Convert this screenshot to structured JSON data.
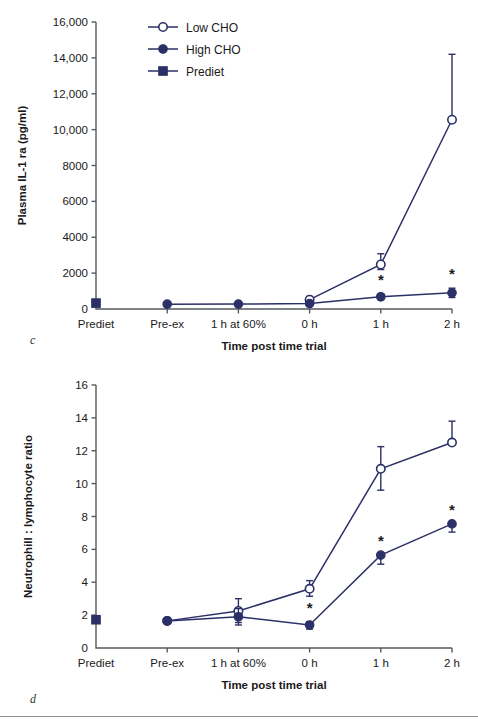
{
  "figure": {
    "background_color": "#ffffff",
    "series_color": "#2b3066",
    "axis_color": "#555a5e",
    "panels": [
      {
        "letter": "c",
        "name": "plasma-il1ra-chart"
      },
      {
        "letter": "d",
        "name": "neutrophil-lymphocyte-chart"
      }
    ]
  },
  "legend": {
    "position": "top-center",
    "entries": [
      {
        "label": "Low CHO",
        "marker": "open-circle-marker"
      },
      {
        "label": "High CHO",
        "marker": "filled-circle-marker"
      },
      {
        "label": "Prediet",
        "marker": "filled-square-marker"
      }
    ]
  },
  "chart_data": [
    {
      "type": "line",
      "panel": "c",
      "title": "",
      "xlabel": "Time post time trial",
      "ylabel": "Plasma IL-1 ra (pg/ml)",
      "categories": [
        "Prediet",
        "Pre-ex",
        "1 h at 60%",
        "0 h",
        "1 h",
        "2 h"
      ],
      "ytick_labels": [
        "0",
        "2000",
        "4000",
        "6000",
        "8000",
        "10,000",
        "12,000",
        "14,000",
        "16,000"
      ],
      "ytick_values": [
        0,
        2000,
        4000,
        6000,
        8000,
        10000,
        12000,
        14000,
        16000
      ],
      "ylim": [
        0,
        16000
      ],
      "grid": false,
      "legend_position": "top-center",
      "series": [
        {
          "name": "Low CHO",
          "marker": "open-circle-marker",
          "values": [
            null,
            null,
            null,
            520,
            2480,
            10550
          ],
          "err_upper": [
            null,
            null,
            null,
            180,
            600,
            3650
          ],
          "err_lower": [
            null,
            null,
            null,
            180,
            280,
            0
          ],
          "significance": [
            null,
            null,
            null,
            null,
            null,
            null
          ]
        },
        {
          "name": "High CHO",
          "marker": "filled-circle-marker",
          "values": [
            null,
            270,
            275,
            300,
            680,
            900
          ],
          "err_upper": [
            null,
            0,
            0,
            0,
            150,
            260
          ],
          "err_lower": [
            null,
            0,
            0,
            0,
            150,
            260
          ],
          "significance": [
            null,
            null,
            null,
            null,
            "*",
            "*"
          ]
        },
        {
          "name": "Prediet",
          "marker": "filled-square-marker",
          "values": [
            330,
            null,
            null,
            null,
            null,
            null
          ],
          "err_upper": [
            0,
            null,
            null,
            null,
            null,
            null
          ],
          "err_lower": [
            0,
            null,
            null,
            null,
            null,
            null
          ],
          "significance": [
            null,
            null,
            null,
            null,
            null,
            null
          ]
        }
      ]
    },
    {
      "type": "line",
      "panel": "d",
      "title": "",
      "xlabel": "Time post time trial",
      "ylabel": "Neutrophill : lymphocyte ratio",
      "categories": [
        "Prediet",
        "Pre-ex",
        "1 h at 60%",
        "0 h",
        "1 h",
        "2 h"
      ],
      "ytick_labels": [
        "0",
        "2",
        "4",
        "6",
        "8",
        "10",
        "12",
        "14",
        "16"
      ],
      "ytick_values": [
        0,
        2,
        4,
        6,
        8,
        10,
        12,
        14,
        16
      ],
      "ylim": [
        0,
        16
      ],
      "grid": false,
      "legend_position": "none",
      "series": [
        {
          "name": "Low CHO",
          "marker": "open-circle-marker",
          "values": [
            null,
            1.65,
            2.25,
            3.6,
            10.9,
            12.5
          ],
          "err_upper": [
            null,
            0,
            0.75,
            0.5,
            1.35,
            1.3
          ],
          "err_lower": [
            null,
            0,
            0.7,
            0.45,
            1.3,
            0
          ],
          "significance": [
            null,
            null,
            null,
            null,
            null,
            null
          ]
        },
        {
          "name": "High CHO",
          "marker": "filled-circle-marker",
          "values": [
            null,
            1.65,
            1.9,
            1.4,
            5.65,
            7.55
          ],
          "err_upper": [
            null,
            0,
            0.5,
            0.2,
            0,
            0
          ],
          "err_lower": [
            null,
            0,
            0.5,
            0.25,
            0.55,
            0.5
          ],
          "significance": [
            null,
            null,
            null,
            "*",
            "*",
            "*"
          ]
        },
        {
          "name": "Prediet",
          "marker": "filled-square-marker",
          "values": [
            1.72,
            null,
            null,
            null,
            null,
            null
          ],
          "err_upper": [
            0,
            null,
            null,
            null,
            null,
            null
          ],
          "err_lower": [
            0,
            null,
            null,
            null,
            null,
            null
          ],
          "significance": [
            null,
            null,
            null,
            null,
            null,
            null
          ]
        }
      ]
    }
  ]
}
